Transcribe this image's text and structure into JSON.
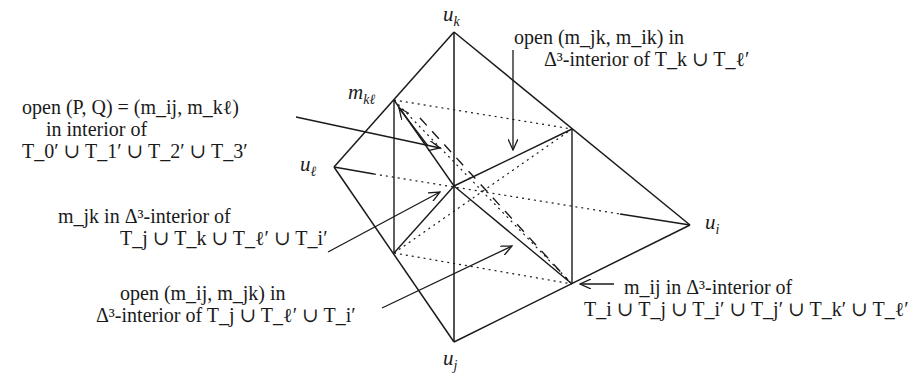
{
  "diagram": {
    "type": "tetrahedron-subdivision",
    "vertices": [
      {
        "id": "u_k",
        "label": "u",
        "sub": "k",
        "x": 454,
        "y": 32
      },
      {
        "id": "u_l",
        "label": "u",
        "sub": "ℓ",
        "x": 334,
        "y": 167
      },
      {
        "id": "u_i",
        "label": "u",
        "sub": "i",
        "x": 690,
        "y": 225
      },
      {
        "id": "u_j",
        "label": "u",
        "sub": "j",
        "x": 454,
        "y": 342
      },
      {
        "id": "m_kl",
        "label": "m",
        "sub": "kℓ",
        "x": 394,
        "y": 100
      },
      {
        "id": "m_ik",
        "label": "",
        "sub": "",
        "x": 572,
        "y": 129
      },
      {
        "id": "m_jk",
        "label": "",
        "sub": "",
        "x": 394,
        "y": 253
      },
      {
        "id": "m_ij",
        "label": "",
        "sub": "",
        "x": 572,
        "y": 284
      },
      {
        "id": "center",
        "label": "",
        "sub": "",
        "x": 454,
        "y": 186
      }
    ],
    "vertex_labels": {
      "uk": {
        "base": "u",
        "sub": "k"
      },
      "ul": {
        "base": "u",
        "sub": "ℓ"
      },
      "ui": {
        "base": "u",
        "sub": "i"
      },
      "uj": {
        "base": "u",
        "sub": "j"
      },
      "mkl": {
        "base": "m",
        "sub": "kℓ"
      }
    },
    "annotations": {
      "pq": {
        "line1": "open (P, Q) = (m_ij, m_kℓ)",
        "line2": "in interior of",
        "line3": "T_0′ ∪ T_1′ ∪ T_2′ ∪ T_3′"
      },
      "mjk": {
        "line1": "m_jk in Δ³-interior of",
        "line2": "T_j ∪ T_k ∪ T_ℓ′ ∪ T_i′"
      },
      "mij_mjk": {
        "line1": "open (m_ij, m_jk) in",
        "line2": "Δ³-interior of T_j ∪ T_ℓ′ ∪ T_i′"
      },
      "mjk_mik": {
        "line1": "open (m_jk, m_ik) in",
        "line2": "Δ³-interior of T_k ∪ T_ℓ′"
      },
      "mij": {
        "line1": "m_ij in Δ³-interior of",
        "line2": "T_i ∪ T_j ∪ T_i′ ∪ T_j′ ∪ T_k′ ∪ T_ℓ′"
      }
    }
  }
}
